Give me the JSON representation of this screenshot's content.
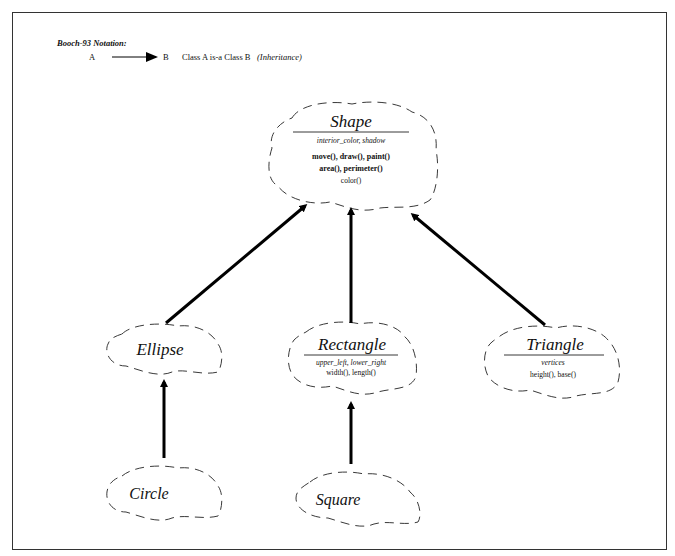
{
  "legend": {
    "title": "Booch-93 Notation:",
    "from": "A",
    "to": "B",
    "description": "Class A  is-a Class B",
    "relationship": "(Inheritance)"
  },
  "classes": {
    "shape": {
      "name": "Shape",
      "attributes": "interior_color, shadow",
      "operations": [
        "move(), draw(), paint()",
        "area(), perimeter()",
        "color()"
      ]
    },
    "ellipse": {
      "name": "Ellipse"
    },
    "rectangle": {
      "name": "Rectangle",
      "attributes": "upper_left, lower_right",
      "operations": [
        "width(), length()"
      ]
    },
    "triangle": {
      "name": "Triangle",
      "attributes": "vertices",
      "operations": [
        "height(), base()"
      ]
    },
    "circle": {
      "name": "Circle"
    },
    "square": {
      "name": "Square"
    }
  },
  "relationships": [
    {
      "from": "Ellipse",
      "to": "Shape",
      "type": "inheritance"
    },
    {
      "from": "Rectangle",
      "to": "Shape",
      "type": "inheritance"
    },
    {
      "from": "Triangle",
      "to": "Shape",
      "type": "inheritance"
    },
    {
      "from": "Circle",
      "to": "Ellipse",
      "type": "inheritance"
    },
    {
      "from": "Square",
      "to": "Rectangle",
      "type": "inheritance"
    }
  ],
  "colors": {
    "ink": "#111111",
    "background": "#ffffff"
  }
}
